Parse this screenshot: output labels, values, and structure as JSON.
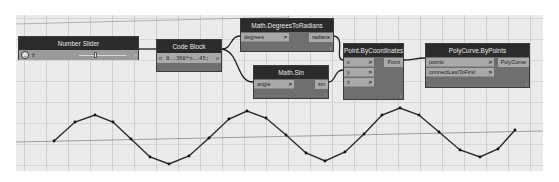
{
  "nodes": {
    "number_slider": {
      "title": "Number Slider",
      "value": "8",
      "expand_glyph": "⌄",
      "output_glyph": ">"
    },
    "code_block": {
      "title": "Code Block",
      "code": "0..360*n..45;",
      "input_label": "n",
      "output_glyph": ">"
    },
    "degrees_to_radians": {
      "title": "Math.DegreesToRadians",
      "inputs": [
        {
          "label": "degrees",
          "arrow": ">"
        }
      ],
      "outputs": [
        "radians"
      ],
      "lacing": "l"
    },
    "math_sin": {
      "title": "Math.Sin",
      "inputs": [
        {
          "label": "angle",
          "arrow": ">"
        }
      ],
      "outputs": [
        "sin"
      ],
      "lacing": "l"
    },
    "point_by_coordinates": {
      "title": "Point.ByCoordinates",
      "inputs": [
        {
          "label": "x",
          "arrow": ">"
        },
        {
          "label": "y",
          "arrow": ">"
        },
        {
          "label": "z",
          "arrow": ">"
        }
      ],
      "outputs": [
        "Point"
      ],
      "lacing": "l"
    },
    "polycurve_by_points": {
      "title": "PolyCurve.ByPoints",
      "inputs": [
        {
          "label": "points",
          "arrow": ">"
        },
        {
          "label": "connectLastToFirst",
          "arrow": ">"
        }
      ],
      "outputs": [
        "PolyCurve"
      ],
      "lacing": "l"
    }
  },
  "preview_curve": {
    "points": [
      [
        54,
        141
      ],
      [
        75,
        122
      ],
      [
        95,
        115
      ],
      [
        113,
        122
      ],
      [
        131,
        139
      ],
      [
        150,
        157
      ],
      [
        169,
        164
      ],
      [
        189,
        156
      ],
      [
        209,
        138
      ],
      [
        229,
        119
      ],
      [
        247,
        111
      ],
      [
        266,
        118
      ],
      [
        286,
        135
      ],
      [
        306,
        153
      ],
      [
        325,
        161
      ],
      [
        345,
        152
      ],
      [
        364,
        134
      ],
      [
        382,
        115
      ],
      [
        400,
        108
      ],
      [
        419,
        115
      ],
      [
        439,
        132
      ],
      [
        460,
        150
      ],
      [
        480,
        157
      ],
      [
        498,
        149
      ],
      [
        515,
        130
      ]
    ],
    "color": "#2a2a2a"
  },
  "colors": {
    "node_header": "#2b2b2b",
    "node_body": "#6f6f6f",
    "port": "#a9a9a9",
    "canvas": "#ebebeb",
    "wire": "#1e1e1e"
  }
}
